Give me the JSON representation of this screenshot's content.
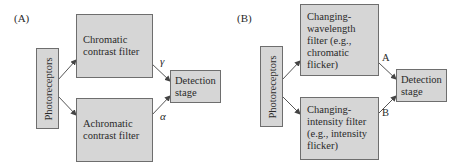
{
  "panels": [
    {
      "label": "(A)",
      "source": "Photoreceptors",
      "top_filter": "Chromatic contrast filter",
      "top_filter_lines": [
        "Chromatic",
        "contrast filter"
      ],
      "bottom_filter": "Achromatic contrast filter",
      "bottom_filter_lines": [
        "Achromatic",
        "contrast filter"
      ],
      "top_weight": "γ",
      "bottom_weight": "α",
      "target_lines": [
        "Detection",
        "stage"
      ]
    },
    {
      "label": "(B)",
      "source": "Photoreceptors",
      "top_filter_lines": [
        "Changing-",
        "wavelength",
        "filter (e.g.,",
        "chromatic",
        "flicker)"
      ],
      "bottom_filter_lines": [
        "Changing-",
        "intensity filter",
        "(e.g., intensity",
        "flicker)"
      ],
      "top_weight": "A",
      "bottom_weight": "B",
      "target_lines": [
        "Detection",
        "stage"
      ]
    }
  ],
  "colors": {
    "box_fill": "#d6d6d6",
    "box_border": "#6e6e6e",
    "line": "#555555"
  }
}
